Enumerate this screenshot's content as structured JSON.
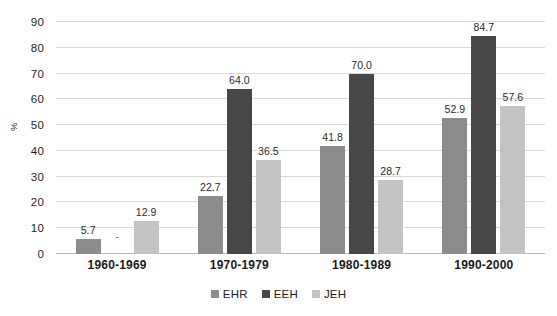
{
  "chart_data": {
    "type": "bar",
    "title": "",
    "subtitle": "",
    "xlabel": "",
    "ylabel": "%",
    "ylim": [
      0,
      90
    ],
    "ytick_step": 10,
    "yticks": [
      0,
      10,
      20,
      30,
      40,
      50,
      60,
      70,
      80,
      90
    ],
    "grid": true,
    "legend_position": "bottom",
    "categories": [
      "1960-1969",
      "1970-1979",
      "1980-1989",
      "1990-2000"
    ],
    "series": [
      {
        "name": "EHR",
        "color": "#8c8c8c",
        "values": [
          5.7,
          22.7,
          41.8,
          52.9
        ],
        "labels": [
          "5.7",
          "22.7",
          "41.8",
          "52.9"
        ]
      },
      {
        "name": "EEH",
        "color": "#474747",
        "values": [
          null,
          64.0,
          70.0,
          84.7
        ],
        "labels": [
          "-",
          "64.0",
          "70.0",
          "84.7"
        ]
      },
      {
        "name": "JEH",
        "color": "#c3c3c3",
        "values": [
          12.9,
          36.5,
          28.7,
          57.6
        ],
        "labels": [
          "12.9",
          "36.5",
          "28.7",
          "57.6"
        ]
      }
    ]
  },
  "axis": {
    "y_title": "%"
  },
  "legend": {
    "items": [
      {
        "label": "EHR",
        "color": "#8c8c8c"
      },
      {
        "label": "EEH",
        "color": "#474747"
      },
      {
        "label": "JEH",
        "color": "#c3c3c3"
      }
    ]
  },
  "colors": {
    "gridline": "#d9d9d9",
    "baseline": "#b8b8b8",
    "text": "#1a1a1a",
    "background": "#ffffff"
  }
}
